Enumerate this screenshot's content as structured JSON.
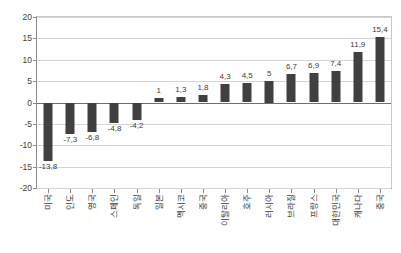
{
  "chart_data": {
    "type": "bar",
    "title": "",
    "subtitle": "",
    "xlabel": "",
    "ylabel": "",
    "ylim": [
      -20,
      20
    ],
    "grid": true,
    "legend": false,
    "legend_position": "none",
    "orientation": "vertical",
    "bar_color": "#404040",
    "categories": [
      "미국",
      "인도",
      "영국",
      "스페인",
      "독일",
      "일본",
      "멕시코",
      "중국",
      "이탈리아",
      "호주",
      "러시아",
      "브라질",
      "프랑스",
      "대한민국",
      "캐나다",
      "중국"
    ],
    "values": [
      -13.8,
      -7.3,
      -6.8,
      -4.8,
      -4.2,
      1,
      1.3,
      1.8,
      4.3,
      4.5,
      5,
      6.7,
      6.9,
      7.4,
      11.9,
      15.4
    ],
    "data_labels": [
      "-13,8",
      "-7,3",
      "-6,8",
      "-4,8",
      "-4,2",
      "1",
      "1,3",
      "1,8",
      "4,3",
      "4,5",
      "5",
      "6,7",
      "6,9",
      "7,4",
      "11,9",
      "15,4"
    ],
    "yticks": [
      20,
      15,
      10,
      5,
      0,
      -5,
      -10,
      -15,
      -20
    ],
    "ytick_labels": [
      "20",
      "15",
      "10",
      "5",
      "0",
      "-5",
      "-10",
      "-15",
      "-20"
    ]
  },
  "colors": {
    "bar": "#404040",
    "grid": "#d5d5d5",
    "axis": "#8a8a8a",
    "zero_line": "#6e6e6e",
    "text": "#3d3d3d",
    "background": "#ffffff"
  }
}
